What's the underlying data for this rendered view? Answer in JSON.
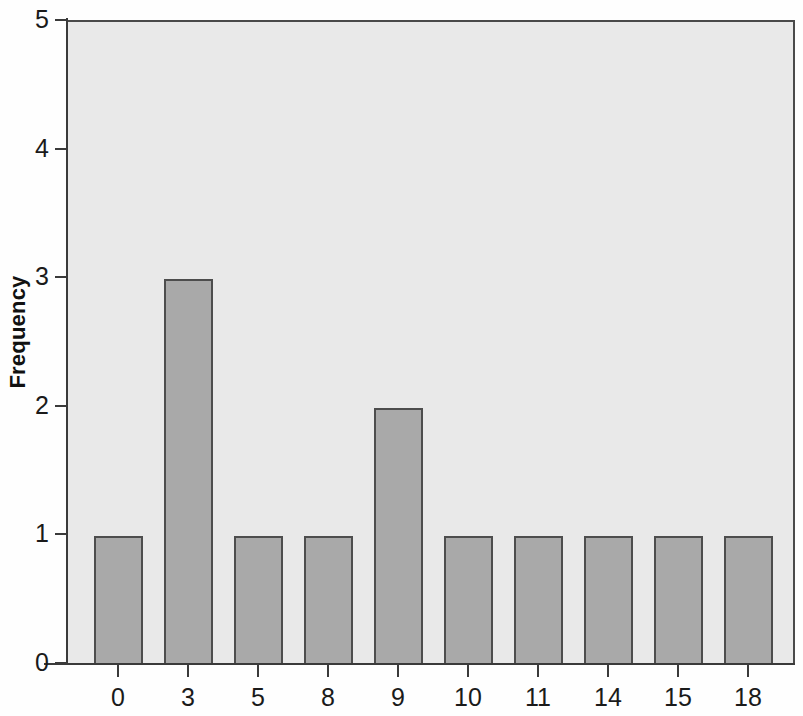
{
  "chart_data": {
    "type": "bar",
    "title": "",
    "xlabel": "",
    "ylabel": "Frequency",
    "categories": [
      "0",
      "3",
      "5",
      "8",
      "9",
      "10",
      "11",
      "14",
      "15",
      "18"
    ],
    "values": [
      1,
      3,
      1,
      1,
      2,
      1,
      1,
      1,
      1,
      1
    ],
    "ylim": [
      0,
      5
    ],
    "yticks": [
      "0",
      "1",
      "2",
      "3",
      "4",
      "5"
    ],
    "grid": false,
    "legend": null,
    "series": [
      {
        "name": "Frequency",
        "values": [
          1,
          3,
          1,
          1,
          2,
          1,
          1,
          1,
          1,
          1
        ]
      }
    ]
  },
  "style": {
    "bar_fill": "#a9a9a9",
    "bar_border": "#4d4d4d",
    "plot_background": "#e9e9e9",
    "figure_background": "#fefefe",
    "axis_color": "#3a3a3a",
    "text_color": "#1a1a1a"
  }
}
